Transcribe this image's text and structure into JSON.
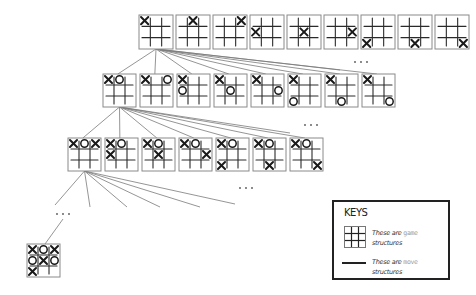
{
  "diagram": {
    "type": "game-tree",
    "rows": [
      {
        "level": 1,
        "boards": [
          [
            "X",
            "",
            "",
            "",
            "",
            "",
            "",
            "",
            ""
          ],
          [
            "",
            "X",
            "",
            "",
            "",
            "",
            "",
            "",
            ""
          ],
          [
            "",
            "",
            "X",
            "",
            "",
            "",
            "",
            "",
            ""
          ],
          [
            "",
            "",
            "",
            "X",
            "",
            "",
            "",
            "",
            ""
          ],
          [
            "",
            "",
            "",
            "",
            "X",
            "",
            "",
            "",
            ""
          ],
          [
            "",
            "",
            "",
            "",
            "",
            "X",
            "",
            "",
            ""
          ],
          [
            "",
            "",
            "",
            "",
            "",
            "",
            "X",
            "",
            ""
          ],
          [
            "",
            "",
            "",
            "",
            "",
            "",
            "",
            "X",
            ""
          ],
          [
            "",
            "",
            "",
            "",
            "",
            "",
            "",
            "",
            "X"
          ]
        ],
        "ellipsis": false
      },
      {
        "level": 2,
        "boards": [
          [
            "X",
            "O",
            "",
            "",
            "",
            "",
            "",
            "",
            ""
          ],
          [
            "X",
            "",
            "O",
            "",
            "",
            "",
            "",
            "",
            ""
          ],
          [
            "X",
            "",
            "",
            "O",
            "",
            "",
            "",
            "",
            ""
          ],
          [
            "X",
            "",
            "",
            "",
            "O",
            "",
            "",
            "",
            ""
          ],
          [
            "X",
            "",
            "",
            "",
            "",
            "O",
            "",
            "",
            ""
          ],
          [
            "X",
            "",
            "",
            "",
            "",
            "",
            "O",
            "",
            ""
          ],
          [
            "X",
            "",
            "",
            "",
            "",
            "",
            "",
            "O",
            ""
          ],
          [
            "X",
            "",
            "",
            "",
            "",
            "",
            "",
            "",
            "O"
          ]
        ],
        "ellipsis": true,
        "ellipsis_label": ". . ."
      },
      {
        "level": 3,
        "boards": [
          [
            "X",
            "O",
            "X",
            "",
            "",
            "",
            "",
            "",
            ""
          ],
          [
            "X",
            "O",
            "",
            "X",
            "",
            "",
            "",
            "",
            ""
          ],
          [
            "X",
            "O",
            "",
            "",
            "X",
            "",
            "",
            "",
            ""
          ],
          [
            "X",
            "O",
            "",
            "",
            "",
            "X",
            "",
            "",
            ""
          ],
          [
            "X",
            "O",
            "",
            "",
            "",
            "",
            "X",
            "",
            ""
          ],
          [
            "X",
            "O",
            "",
            "",
            "",
            "",
            "",
            "X",
            ""
          ],
          [
            "X",
            "O",
            "",
            "",
            "",
            "",
            "",
            "",
            "X"
          ]
        ],
        "ellipsis": true,
        "ellipsis_label": ". . ."
      },
      {
        "level": 4,
        "boards": [],
        "ellipsis": true,
        "ellipsis_label": ". . ."
      },
      {
        "level": "final",
        "boards": [
          [
            "X",
            "O",
            "X",
            "O",
            "X",
            "O",
            "X",
            "",
            ""
          ]
        ],
        "ellipsis": false
      }
    ],
    "intermediate_ellipsis_label": ". . ."
  },
  "key": {
    "title": "KEYS",
    "game_text_prefix": "These are ",
    "game_text_accent": "game",
    "game_text_suffix": "structures",
    "move_text_prefix": "These are ",
    "move_text_accent": "move",
    "move_text_suffix": "structures"
  },
  "colors": {
    "grid": "#2a2a2a",
    "marks": "#1a1a1a",
    "edges": "#7a7a7a",
    "accent_text": "#9a9a9a",
    "key_border": "#222222"
  }
}
